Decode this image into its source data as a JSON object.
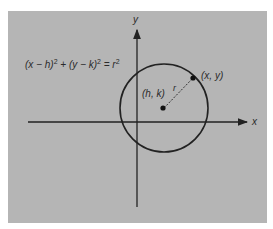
{
  "figure": {
    "equation": {
      "part1": "(x − h)",
      "exp1": "2",
      "part2": " + (y − k)",
      "exp2": "2",
      "part3": " = r",
      "exp3": "2"
    },
    "axes": {
      "x_label": "x",
      "y_label": "y"
    },
    "center_label": "(h, k)",
    "point_label": "(x, y)",
    "radius_label": "r"
  },
  "colors": {
    "panel": "#b5b5b5",
    "ink": "#222222"
  }
}
